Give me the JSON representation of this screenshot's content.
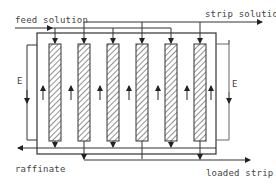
{
  "diagram": {
    "type": "countercurrent mixer-settler / extraction column cascade",
    "labels": {
      "feed": "feed solution",
      "strip": "strip solution",
      "raffinate": "raffinate",
      "loaded": "loaded strip",
      "e_left": "E",
      "e_right": "E"
    },
    "columns": [
      {
        "index": 1,
        "cx": 55,
        "feed_from": "feed solution",
        "flow": "up"
      },
      {
        "index": 2,
        "cx": 84,
        "feed_from": "strip solution",
        "flow": "up"
      },
      {
        "index": 3,
        "cx": 113,
        "feed_from": "feed solution",
        "flow": "up"
      },
      {
        "index": 4,
        "cx": 142,
        "feed_from": "strip solution",
        "flow": "up"
      },
      {
        "index": 5,
        "cx": 171,
        "feed_from": "feed solution",
        "flow": "up"
      },
      {
        "index": 6,
        "cx": 200,
        "feed_from": "strip solution",
        "flow": "up"
      }
    ],
    "colors": {
      "line": "#333333",
      "hatch": "#555555",
      "text": "#444444",
      "background": "#ffffff"
    }
  }
}
